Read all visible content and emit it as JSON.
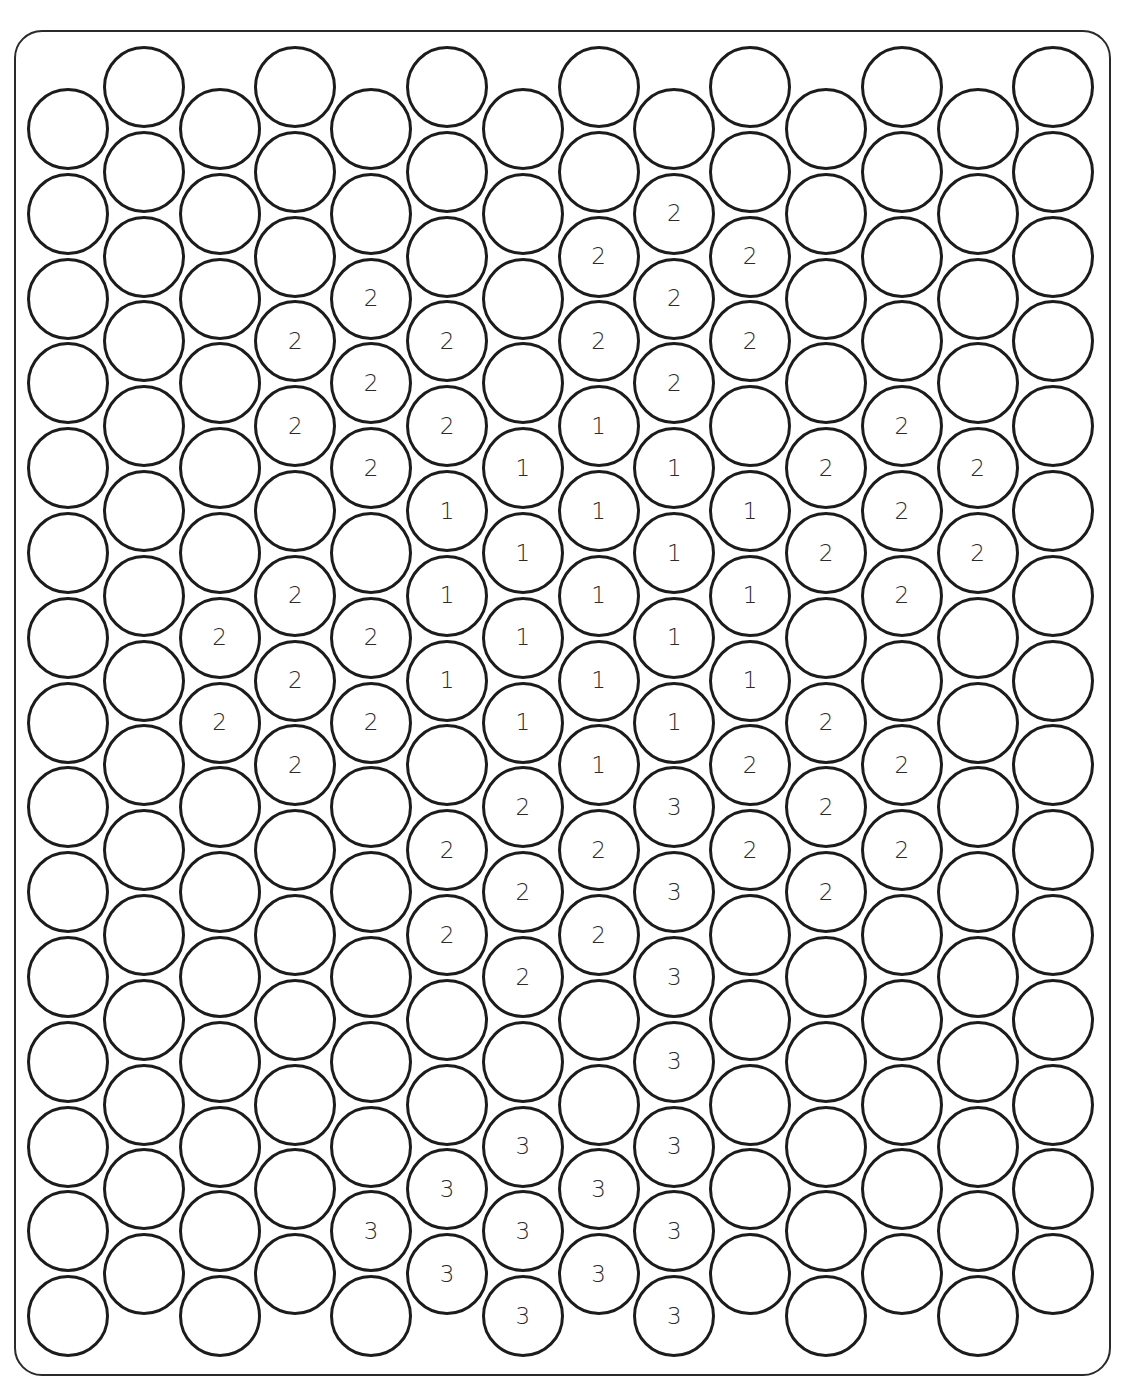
{
  "puzzle": {
    "type": "color-by-number-hex-bubbles",
    "grid": {
      "columns": 14,
      "rows_per_column": 15,
      "col_x0": 68,
      "col_dx": 75.8,
      "row_dy": 84.8,
      "even_col_y0": 129,
      "odd_col_y0": 87,
      "radius": 41
    },
    "colors": {
      "stroke": "#1c1c1c",
      "fill": "#ffffff",
      "label": "#2a2a2a",
      "border": "#2a2a2a"
    },
    "labels": {
      "2": {
        "6": "2",
        "7": "2"
      },
      "3": {
        "3": "2",
        "4": "2",
        "6": "2",
        "7": "2",
        "8": "2"
      },
      "4": {
        "2": "2",
        "3": "2",
        "4": "2",
        "6": "2",
        "7": "2",
        "13": "3"
      },
      "5": {
        "3": "2",
        "4": "2",
        "5": "1",
        "6": "1",
        "7": "1",
        "9": "2",
        "10": "2",
        "13": "3",
        "14": "3"
      },
      "6": {
        "4": "1",
        "5": "1",
        "6": "1",
        "7": "1",
        "8": "2",
        "9": "2",
        "10": "2",
        "12": "3",
        "13": "3",
        "14": "3"
      },
      "7": {
        "2": "2",
        "3": "2",
        "4": "1",
        "5": "1",
        "6": "1",
        "7": "1",
        "8": "1",
        "9": "2",
        "10": "2",
        "13": "3",
        "14": "3"
      },
      "8": {
        "1": "2",
        "2": "2",
        "3": "2",
        "4": "1",
        "5": "1",
        "6": "1",
        "7": "1",
        "8": "3",
        "9": "3",
        "10": "3",
        "11": "3",
        "12": "3",
        "13": "3",
        "14": "3"
      },
      "9": {
        "2": "2",
        "3": "2",
        "5": "1",
        "6": "1",
        "7": "1",
        "8": "2",
        "9": "2"
      },
      "10": {
        "4": "2",
        "5": "2",
        "7": "2",
        "8": "2",
        "9": "2"
      },
      "11": {
        "4": "2",
        "5": "2",
        "6": "2",
        "8": "2",
        "9": "2"
      },
      "12": {
        "4": "2",
        "5": "2"
      }
    }
  }
}
